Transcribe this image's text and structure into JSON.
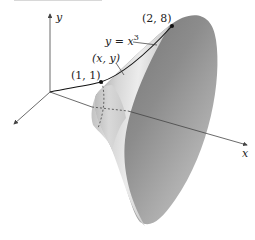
{
  "figure": {
    "type": "surface-of-revolution",
    "axes": {
      "x_label": "x",
      "y_label": "y"
    },
    "curve": {
      "equation_prefix": "y = x",
      "equation_exponent": "3",
      "point_label": "(x, y)"
    },
    "points": [
      {
        "label": "(1, 1)"
      },
      {
        "label": "(2, 8)"
      }
    ],
    "colors": {
      "surface_dark": "#7a7a7a",
      "surface_light": "#e2e2e2",
      "axis": "#444444",
      "curve": "#111111"
    }
  }
}
